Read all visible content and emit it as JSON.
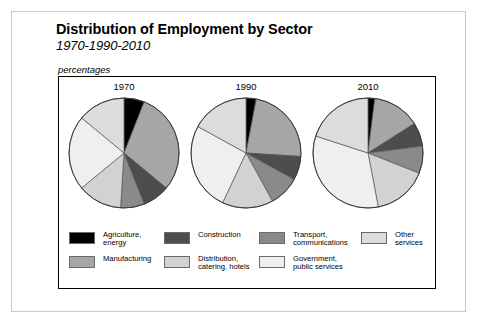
{
  "figure": {
    "title": "Distribution of Employment by Sector",
    "subtitle": "1970-1990-2010",
    "units": "percentages"
  },
  "legend": [
    {
      "key": "agriculture",
      "label": "Agriculture,\nenergy",
      "color": "#000000"
    },
    {
      "key": "manufacturing",
      "label": "Manufacturing",
      "color": "#a6a6a6"
    },
    {
      "key": "construction",
      "label": "Construction",
      "color": "#4d4d4d"
    },
    {
      "key": "distribution",
      "label": "Distribution,\ncatering, hotels",
      "color": "#d2d2d2"
    },
    {
      "key": "transport",
      "label": "Transport,\ncommunications",
      "color": "#8a8a8a"
    },
    {
      "key": "government",
      "label": "Government,\npublic services",
      "color": "#efefef"
    },
    {
      "key": "other",
      "label": "Other\nservices",
      "color": "#dcdcdc"
    }
  ],
  "chart_data": {
    "type": "pie",
    "title": "Distribution of Employment by Sector",
    "subtitle": "1970-1990-2010",
    "units": "percentages",
    "ylabel": "",
    "xlabel": "",
    "legend_position": "bottom",
    "categories": [
      "Agriculture, energy",
      "Manufacturing",
      "Construction",
      "Transport, communications",
      "Distribution, catering, hotels",
      "Government, public services",
      "Other services"
    ],
    "colors": [
      "#000000",
      "#a6a6a6",
      "#4d4d4d",
      "#8a8a8a",
      "#d2d2d2",
      "#efefef",
      "#dcdcdc"
    ],
    "pies": [
      {
        "title": "1970",
        "values": [
          6,
          30,
          8,
          7,
          13,
          22,
          14
        ]
      },
      {
        "title": "1990",
        "values": [
          3,
          23,
          7,
          9,
          15,
          26,
          17
        ]
      },
      {
        "title": "2010",
        "values": [
          2,
          14,
          7,
          8,
          16,
          33,
          20
        ]
      }
    ]
  }
}
